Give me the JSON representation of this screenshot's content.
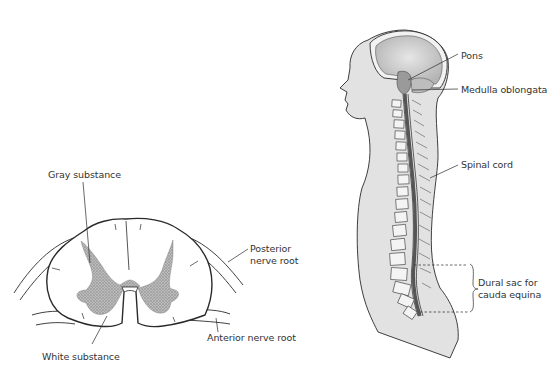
{
  "figure": {
    "cross_section": {
      "title": "Spinal cord cross-section",
      "labels": {
        "gray_substance": "Gray substance",
        "posterior_nerve_root_1": "Posterior",
        "posterior_nerve_root_2": "nerve root",
        "anterior_nerve_root": "Anterior nerve root",
        "white_substance": "White substance"
      }
    },
    "sagittal_view": {
      "title": "Sagittal view of brain and spine",
      "labels": {
        "pons": "Pons",
        "medulla_oblongata": "Medulla oblongata",
        "spinal_cord": "Spinal cord",
        "dural_sac_1": "Dural sac for",
        "dural_sac_2": "cauda equina"
      }
    },
    "colors": {
      "line": "#2a2a2a",
      "gray_matter": "#a9a9a9",
      "body_fill": "#e4e4e4",
      "brain_fill": "#c8c8c8"
    }
  }
}
